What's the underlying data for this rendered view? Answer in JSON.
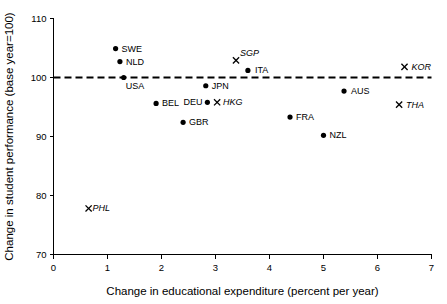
{
  "chart_data": {
    "type": "scatter",
    "title": "",
    "xlabel": "Change in educational expenditure (percent per year)",
    "ylabel": "Change in student performance (base year=100)",
    "xlim": [
      0,
      7
    ],
    "ylim": [
      70,
      110
    ],
    "xticks": [
      0,
      1,
      2,
      3,
      4,
      5,
      6,
      7
    ],
    "yticks": [
      70,
      80,
      90,
      100,
      110
    ],
    "xtick_labels": [
      "0",
      "1",
      "2",
      "3",
      "4",
      "5",
      "6",
      "7"
    ],
    "ytick_labels": [
      "70",
      "80",
      "90",
      "100",
      "110"
    ],
    "grid": false,
    "legend": "none",
    "reference_line": {
      "name": "base-year-100-line",
      "orientation": "horizontal",
      "y": 100,
      "style": "dashed",
      "color": "#000000"
    },
    "points": [
      {
        "label": "SWE",
        "x": 1.15,
        "y": 104.9,
        "marker": "dot",
        "italic": false,
        "label_dx": 6,
        "label_dy": 3
      },
      {
        "label": "NLD",
        "x": 1.23,
        "y": 102.7,
        "marker": "dot",
        "italic": false,
        "label_dx": 6,
        "label_dy": 3
      },
      {
        "label": "USA",
        "x": 1.3,
        "y": 100.0,
        "marker": "dot",
        "italic": false,
        "label_dx": 2,
        "label_dy": 11
      },
      {
        "label": "BEL",
        "x": 1.9,
        "y": 95.6,
        "marker": "dot",
        "italic": false,
        "label_dx": 6,
        "label_dy": 3
      },
      {
        "label": "GBR",
        "x": 2.4,
        "y": 92.4,
        "marker": "dot",
        "italic": false,
        "label_dx": 6,
        "label_dy": 3
      },
      {
        "label": "DEU",
        "x": 2.85,
        "y": 95.8,
        "marker": "dot",
        "italic": false,
        "label_dx": -24,
        "label_dy": 3
      },
      {
        "label": "HKG",
        "x": 3.03,
        "y": 95.8,
        "marker": "cross",
        "italic": true,
        "label_dx": 6,
        "label_dy": 3
      },
      {
        "label": "JPN",
        "x": 2.82,
        "y": 98.6,
        "marker": "dot",
        "italic": false,
        "label_dx": 6,
        "label_dy": 3
      },
      {
        "label": "SGP",
        "x": 3.38,
        "y": 102.9,
        "marker": "cross",
        "italic": true,
        "label_dx": 4,
        "label_dy": -4
      },
      {
        "label": "ITA",
        "x": 3.6,
        "y": 101.2,
        "marker": "dot",
        "italic": false,
        "label_dx": 7,
        "label_dy": 3
      },
      {
        "label": "FRA",
        "x": 4.38,
        "y": 93.3,
        "marker": "dot",
        "italic": false,
        "label_dx": 6,
        "label_dy": 3
      },
      {
        "label": "NZL",
        "x": 5.0,
        "y": 90.2,
        "marker": "dot",
        "italic": false,
        "label_dx": 6,
        "label_dy": 3
      },
      {
        "label": "AUS",
        "x": 5.38,
        "y": 97.7,
        "marker": "dot",
        "italic": false,
        "label_dx": 7,
        "label_dy": 3
      },
      {
        "label": "KOR",
        "x": 6.5,
        "y": 101.8,
        "marker": "cross",
        "italic": true,
        "label_dx": 7,
        "label_dy": 3
      },
      {
        "label": "THA",
        "x": 6.4,
        "y": 95.4,
        "marker": "cross",
        "italic": true,
        "label_dx": 7,
        "label_dy": 3
      },
      {
        "label": "PHL",
        "x": 0.65,
        "y": 77.8,
        "marker": "cross",
        "italic": true,
        "label_dx": 4,
        "label_dy": 3
      }
    ]
  }
}
